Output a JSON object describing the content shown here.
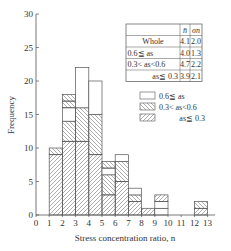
{
  "chart_data": {
    "type": "bar",
    "stacked": true,
    "title": "",
    "xlabel": "Stress concentration ratio, n",
    "ylabel": "Frequency",
    "xlim": [
      0,
      13
    ],
    "ylim": [
      0,
      30
    ],
    "xticks": [
      "0",
      "1",
      "2",
      "3",
      "4",
      "5",
      "6",
      "7",
      "8",
      "9",
      "10",
      "11",
      "12",
      "13"
    ],
    "yticks": [
      "0",
      "5",
      "10",
      "15",
      "20",
      "25",
      "30"
    ],
    "grid": false,
    "bins": [
      {
        "range": [
          1,
          2
        ],
        "segments": [
          {
            "series": "as<=0.3",
            "value": 9
          },
          {
            "series": "0.3<as<0.6",
            "value": 1
          }
        ]
      },
      {
        "range": [
          2,
          3
        ],
        "segments": [
          {
            "series": "as<=0.3",
            "value": 11
          },
          {
            "series": "0.3<as<0.6",
            "value": 3
          },
          {
            "series": "0.6<=as",
            "value": 2
          },
          {
            "series": "0.3<as<0.6",
            "value": 1
          },
          {
            "series": "0.3<as<0.6",
            "value": 1
          }
        ]
      },
      {
        "range": [
          3,
          4
        ],
        "segments": [
          {
            "series": "as<=0.3",
            "value": 11
          },
          {
            "series": "0.3<as<0.6",
            "value": 5
          },
          {
            "series": "0.6<=as",
            "value": 6
          }
        ]
      },
      {
        "range": [
          4,
          5
        ],
        "segments": [
          {
            "series": "as<=0.3",
            "value": 9
          },
          {
            "series": "0.3<as<0.6",
            "value": 6
          },
          {
            "series": "0.6<=as",
            "value": 5
          }
        ]
      },
      {
        "range": [
          5,
          6
        ],
        "segments": [
          {
            "series": "as<=0.3",
            "value": 3
          },
          {
            "series": "0.3<as<0.6",
            "value": 3
          },
          {
            "series": "0.6<=as",
            "value": 1
          },
          {
            "series": "0.3<as<0.6",
            "value": 1
          }
        ]
      },
      {
        "range": [
          6,
          7
        ],
        "segments": [
          {
            "series": "as<=0.3",
            "value": 5
          },
          {
            "series": "0.3<as<0.6",
            "value": 3
          },
          {
            "series": "0.6<=as",
            "value": 1
          }
        ]
      },
      {
        "range": [
          7,
          8
        ],
        "segments": [
          {
            "series": "as<=0.3",
            "value": 2
          },
          {
            "series": "0.3<as<0.6",
            "value": 1
          },
          {
            "series": "0.6<=as",
            "value": 1
          }
        ]
      },
      {
        "range": [
          8,
          9
        ],
        "segments": [
          {
            "series": "as<=0.3",
            "value": 1
          }
        ]
      },
      {
        "range": [
          9,
          10
        ],
        "segments": [
          {
            "series": "0.6<=as",
            "value": 1
          },
          {
            "series": "0.6<=as",
            "value": 1
          },
          {
            "series": "as<=0.3",
            "value": 1
          }
        ]
      },
      {
        "range": [
          12,
          13
        ],
        "segments": [
          {
            "series": "as<=0.3",
            "value": 1
          },
          {
            "series": "0.3<as<0.6",
            "value": 1
          }
        ]
      }
    ],
    "legend": {
      "placement": "top-right",
      "entries": [
        {
          "key": "0.6<=as",
          "label": "0.6≦ as",
          "pattern": "none"
        },
        {
          "key": "0.3<as<0.6",
          "label": "0.3< as<0.6",
          "pattern": "back-hatch"
        },
        {
          "key": "as<=0.3",
          "label": "as≦ 0.3",
          "pattern": "forward-hatch"
        }
      ]
    },
    "stats_table": {
      "headers": [
        "",
        "n̄",
        "σn"
      ],
      "rows": [
        [
          "Whole",
          "4.1",
          "2.0"
        ],
        [
          "0.6≦ as",
          "4.0",
          "1.3"
        ],
        [
          "0.3< as<0.6",
          "4.7",
          "2.2"
        ],
        [
          "as≦ 0.3",
          "3.9",
          "2.1"
        ]
      ]
    }
  }
}
